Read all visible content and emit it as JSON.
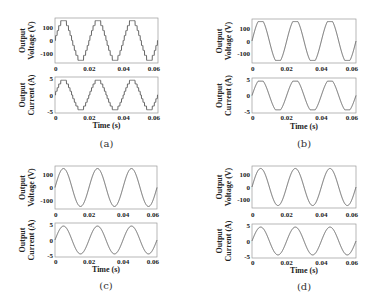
{
  "chart_data": [
    {
      "id": "a",
      "type": "line",
      "caption": "(a)",
      "waveform": "staircase",
      "subplots": [
        {
          "ylabel": [
            "Output",
            "Voltage (V)"
          ],
          "yticks": [
            "100",
            "0",
            "-100"
          ],
          "yvals": [
            100,
            0,
            -100
          ],
          "ylim": [
            -170,
            170
          ],
          "amplitude": 150,
          "xticks": [
            "0",
            "0.02",
            "0.04",
            "0.06"
          ]
        },
        {
          "ylabel": [
            "Output",
            "Current (A)"
          ],
          "yticks": [
            "5",
            "0",
            "-5"
          ],
          "yvals": [
            5,
            0,
            -5
          ],
          "ylim": [
            -5.5,
            5.5
          ],
          "amplitude": 4.5,
          "xticks": [
            "0",
            "0.02",
            "0.04",
            "0.06"
          ]
        }
      ],
      "xlabel": "Time (s)",
      "xlim": [
        0,
        0.06
      ],
      "frequency_hz": 50
    },
    {
      "id": "b",
      "type": "line",
      "caption": "(b)",
      "waveform": "clipped-sine",
      "subplots": [
        {
          "ylabel": [
            "Output",
            "Voltage (V)"
          ],
          "yticks": [
            "100",
            "0",
            "-100"
          ],
          "yvals": [
            100,
            0,
            -100
          ],
          "ylim": [
            -170,
            170
          ],
          "amplitude": 150,
          "xticks": [
            "0",
            "0.02",
            "0.04",
            "0.06"
          ]
        },
        {
          "ylabel": [
            "Output",
            "Current (A)"
          ],
          "yticks": [
            "5",
            "0",
            "-5"
          ],
          "yvals": [
            5,
            0,
            -5
          ],
          "ylim": [
            -5.5,
            5.5
          ],
          "amplitude": 4.5,
          "xticks": [
            "0",
            "0.02",
            "0.04",
            "0.06"
          ]
        }
      ],
      "xlabel": "Time (s)",
      "xlim": [
        0,
        0.06
      ],
      "frequency_hz": 50
    },
    {
      "id": "c",
      "type": "line",
      "caption": "(c)",
      "waveform": "sine",
      "subplots": [
        {
          "ylabel": [
            "Output",
            "Voltage (V)"
          ],
          "yticks": [
            "100",
            "0",
            "-100"
          ],
          "yvals": [
            100,
            0,
            -100
          ],
          "ylim": [
            -170,
            170
          ],
          "amplitude": 150,
          "xticks": [
            "0",
            "0.02",
            "0.04",
            "0.06"
          ]
        },
        {
          "ylabel": [
            "Output",
            "Current (A)"
          ],
          "yticks": [
            "5",
            "0",
            "-5"
          ],
          "yvals": [
            5,
            0,
            -5
          ],
          "ylim": [
            -5.5,
            5.5
          ],
          "amplitude": 4.5,
          "xticks": [
            "0",
            "0.02",
            "0.04",
            "0.06"
          ]
        }
      ],
      "xlabel": "Time (s)",
      "xlim": [
        0,
        0.06
      ],
      "frequency_hz": 50
    },
    {
      "id": "d",
      "type": "line",
      "caption": "(d)",
      "waveform": "sine",
      "subplots": [
        {
          "ylabel": [
            "Output",
            "Voltage (V)"
          ],
          "yticks": [
            "100",
            "0",
            "-100"
          ],
          "yvals": [
            100,
            0,
            -100
          ],
          "ylim": [
            -170,
            170
          ],
          "amplitude": 150,
          "xticks": [
            "0",
            "0.02",
            "0.04",
            "0.06"
          ]
        },
        {
          "ylabel": [
            "Output",
            "Current (A)"
          ],
          "yticks": [
            "5",
            "0",
            "-5"
          ],
          "yvals": [
            5,
            0,
            -5
          ],
          "ylim": [
            -5.5,
            5.5
          ],
          "amplitude": 4.5,
          "xticks": [
            "0",
            "0.02",
            "0.04",
            "0.06"
          ]
        }
      ],
      "xlabel": "Time (s)",
      "xlim": [
        0,
        0.06
      ],
      "frequency_hz": 50
    }
  ],
  "layout": {
    "panels": [
      {
        "left": 55,
        "right": 158,
        "v": [
          18,
          63
        ],
        "vt": 71,
        "c": [
          77,
          113
        ],
        "ct": 120,
        "xl": 128,
        "cap": 147
      },
      {
        "left": 252,
        "right": 356,
        "v": [
          19,
          63
        ],
        "vt": 71,
        "c": [
          78,
          113
        ],
        "ct": 120,
        "xl": 129,
        "cap": 147
      },
      {
        "left": 55,
        "right": 157,
        "v": [
          166,
          209
        ],
        "vt": 217,
        "c": [
          223,
          257
        ],
        "ct": 264,
        "xl": 272,
        "cap": 289
      },
      {
        "left": 252,
        "right": 356,
        "v": [
          166,
          208
        ],
        "vt": 217,
        "c": [
          224,
          258
        ],
        "ct": 265,
        "xl": 273,
        "cap": 290
      }
    ]
  }
}
